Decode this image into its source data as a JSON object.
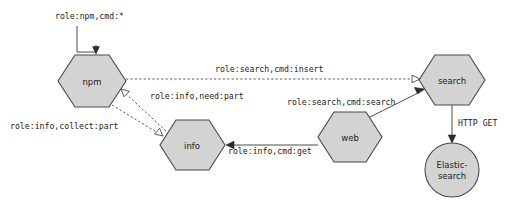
{
  "diagram": {
    "background_color": "#ffffff",
    "node_fill": "#d3d3d3",
    "node_stroke": "#4a4a4a",
    "nodes": [
      {
        "id": "npm",
        "label": "npm",
        "shape": "hexagon",
        "cx": 92,
        "cy": 81,
        "rx": 33,
        "ry": 26
      },
      {
        "id": "search",
        "label": "search",
        "shape": "hexagon",
        "cx": 452,
        "cy": 80,
        "rx": 33,
        "ry": 25
      },
      {
        "id": "info",
        "label": "info",
        "shape": "hexagon",
        "cx": 192,
        "cy": 145,
        "rx": 33,
        "ry": 25
      },
      {
        "id": "web",
        "label": "web",
        "shape": "hexagon",
        "cx": 350,
        "cy": 137,
        "rx": 32,
        "ry": 25
      },
      {
        "id": "elasticsearch",
        "label_line1": "Elastic-",
        "label_line2": "search",
        "shape": "circle",
        "cx": 452,
        "cy": 170,
        "r": 27
      }
    ],
    "edges": [
      {
        "id": "npm-self",
        "label": "role:npm,cmd:*",
        "from": "external",
        "to": "npm",
        "style": "solid",
        "arrow": "filled"
      },
      {
        "id": "npm-search",
        "label": "role:search,cmd:insert",
        "from": "npm",
        "to": "search",
        "style": "dashed",
        "arrow": "hollow"
      },
      {
        "id": "info-npm",
        "label": "role:info,need:part",
        "from": "info",
        "to": "npm",
        "style": "dashed",
        "arrow": "hollow"
      },
      {
        "id": "npm-info",
        "label": "role:info,collect:part",
        "from": "npm",
        "to": "info",
        "style": "dashed",
        "arrow": "hollow"
      },
      {
        "id": "web-search",
        "label": "role:search,cmd:search",
        "from": "web",
        "to": "search",
        "style": "solid",
        "arrow": "filled"
      },
      {
        "id": "web-info",
        "label": "role:info,cmd:get",
        "from": "web",
        "to": "info",
        "style": "solid",
        "arrow": "filled"
      },
      {
        "id": "search-es",
        "label": "HTTP GET",
        "from": "search",
        "to": "elasticsearch",
        "style": "solid",
        "arrow": "filled"
      }
    ]
  }
}
